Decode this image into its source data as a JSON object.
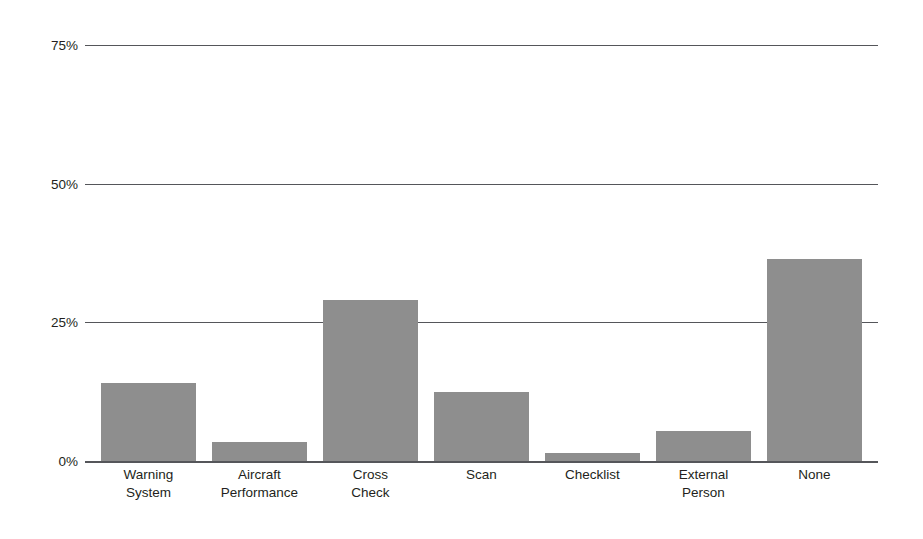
{
  "chart_data": {
    "type": "bar",
    "title": "",
    "subtitle": "",
    "xlabel": "",
    "ylabel": "",
    "categories": [
      "Warning System",
      "Aircraft Performance",
      "Cross Check",
      "Scan",
      "Checklist",
      "External Person",
      "None"
    ],
    "category_lines": [
      [
        "Warning",
        "System"
      ],
      [
        "Aircraft",
        "Performance"
      ],
      [
        "Cross",
        "Check"
      ],
      [
        "Scan",
        ""
      ],
      [
        "Checklist",
        ""
      ],
      [
        "External",
        "Person"
      ],
      [
        "None",
        ""
      ]
    ],
    "values": [
      14,
      3.5,
      29,
      12.5,
      1.5,
      5.5,
      36.5
    ],
    "value_unit": "%",
    "ylim": [
      0,
      75
    ],
    "yticks": [
      0,
      25,
      50,
      75
    ],
    "ytick_labels": [
      "0%",
      "25%",
      "50%",
      "75%"
    ],
    "grid": true,
    "grid_axis": "y",
    "legend": false,
    "legend_position": "none",
    "series": [
      {
        "name": "Share of responses",
        "values": [
          14,
          3.5,
          29,
          12.5,
          1.5,
          5.5,
          36.5
        ]
      }
    ]
  },
  "style": {
    "bar_color": "#8e8e8e",
    "grid_color": "#55565a",
    "axis_color": "#55565a",
    "text_color": "#231f20",
    "background": "#ffffff"
  }
}
